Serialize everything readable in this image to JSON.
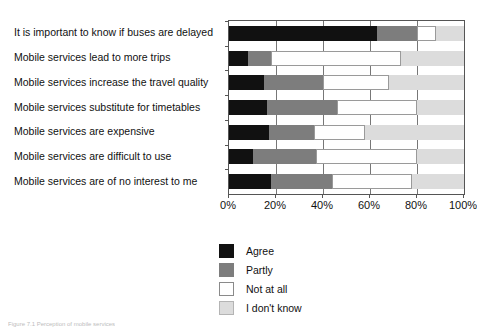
{
  "chart_data": {
    "type": "bar",
    "orientation": "horizontal",
    "stacked": true,
    "normalized_percent": true,
    "title": "",
    "xlabel": "",
    "ylabel": "",
    "xlim": [
      0,
      100
    ],
    "grid": true,
    "legend_position": "bottom-center",
    "xticks": [
      "0%",
      "20%",
      "40%",
      "60%",
      "80%",
      "100%"
    ],
    "xtick_values": [
      0,
      20,
      40,
      60,
      80,
      100
    ],
    "categories": [
      "It is important to know if buses are delayed",
      "Mobile services lead to more trips",
      "Mobile services increase the travel quality",
      "Mobile services substitute for timetables",
      "Mobile services are expensive",
      "Mobile services are difficult to use",
      "Mobile services are of no interest to me"
    ],
    "series": [
      {
        "name": "Agree",
        "color": "#111111",
        "values": [
          63,
          8,
          15,
          16,
          17,
          10,
          18
        ]
      },
      {
        "name": "Partly",
        "color": "#7d7d7d",
        "values": [
          17,
          10,
          25,
          30,
          19,
          27,
          26
        ]
      },
      {
        "name": "Not at all",
        "color": "#ffffff",
        "values": [
          8,
          55,
          28,
          34,
          22,
          43,
          34
        ]
      },
      {
        "name": "I don't know",
        "color": "#dcdcdc",
        "values": [
          12,
          27,
          32,
          20,
          42,
          20,
          22
        ]
      }
    ]
  },
  "legend": {
    "items": [
      {
        "label": "Agree",
        "color": "#111111"
      },
      {
        "label": "Partly",
        "color": "#7d7d7d"
      },
      {
        "label": "Not at all",
        "color": "#ffffff"
      },
      {
        "label": "I don't know",
        "color": "#dcdcdc"
      }
    ]
  },
  "caption": {
    "text": "Figure 7.1 Perception of mobile services"
  }
}
